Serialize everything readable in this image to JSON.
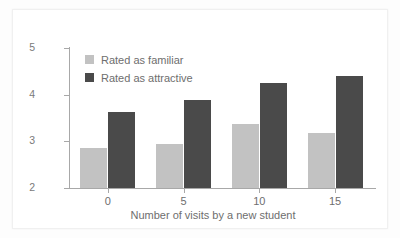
{
  "chart_data": {
    "type": "bar",
    "title": "",
    "subtitle": "",
    "xlabel": "Number of visits by a new student",
    "ylabel": "",
    "categories": [
      "0",
      "5",
      "10",
      "15"
    ],
    "series": [
      {
        "name": "Rated as familiar",
        "color": "#c2c2c2",
        "values": [
          2.85,
          2.95,
          3.38,
          3.18
        ]
      },
      {
        "name": "Rated as attractive",
        "color": "#4a4a4a",
        "values": [
          3.62,
          3.88,
          4.25,
          4.4
        ]
      }
    ],
    "ylim": [
      2,
      5
    ],
    "yticks": [
      "2",
      "3",
      "4",
      "5"
    ],
    "ytick_values": [
      2,
      3,
      4,
      5
    ],
    "xticks": [
      "0",
      "5",
      "10",
      "15"
    ],
    "grid": false,
    "legend_position": "top-left",
    "axis_color": "#a8a8a8",
    "text_color": "#6e6e6e",
    "background_color": "#ffffff"
  },
  "legend": {
    "entries": [
      {
        "label": "Rated as familiar",
        "swatch": "familiar"
      },
      {
        "label": "Rated as attractive",
        "swatch": "attractive"
      }
    ]
  }
}
